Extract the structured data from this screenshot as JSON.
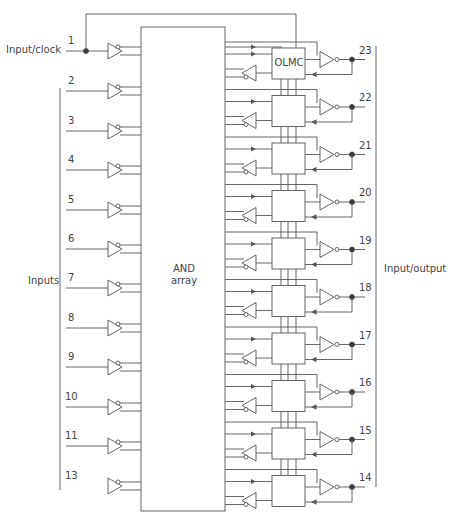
{
  "diagram": {
    "title": "",
    "and_array": {
      "line1": "AND",
      "line2": "array"
    },
    "olmc_label": "OLMC",
    "labels": {
      "input_clock": "Input/clock",
      "inputs": "Inputs",
      "input_output": "Input/output"
    },
    "input_pins": [
      "1",
      "2",
      "3",
      "4",
      "5",
      "6",
      "7",
      "8",
      "9",
      "10",
      "11",
      "13"
    ],
    "io_pins": [
      "23",
      "22",
      "21",
      "20",
      "19",
      "18",
      "17",
      "16",
      "15",
      "14"
    ],
    "colors": {
      "line": "#555555",
      "text": "#444444",
      "background": "#ffffff"
    }
  }
}
